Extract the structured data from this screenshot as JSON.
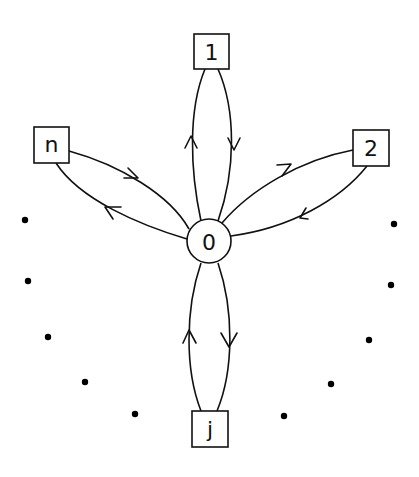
{
  "diagram": {
    "hub": {
      "label": "0",
      "cx": 209,
      "cy": 241,
      "r": 22
    },
    "nodes": [
      {
        "id": "1",
        "label": "1",
        "x": 194,
        "y": 34,
        "w": 35,
        "h": 35
      },
      {
        "id": "2",
        "label": "2",
        "x": 353,
        "y": 130,
        "w": 36,
        "h": 36
      },
      {
        "id": "n",
        "label": "n",
        "x": 34,
        "y": 127,
        "w": 35,
        "h": 36
      },
      {
        "id": "j",
        "label": "j",
        "x": 192,
        "y": 411,
        "w": 36,
        "h": 36
      }
    ],
    "edges": [
      {
        "from": "0",
        "to": "1",
        "direction": "up"
      },
      {
        "from": "1",
        "to": "0",
        "direction": "down"
      },
      {
        "from": "0",
        "to": "2",
        "direction": "out"
      },
      {
        "from": "2",
        "to": "0",
        "direction": "in"
      },
      {
        "from": "n",
        "to": "0",
        "direction": "in"
      },
      {
        "from": "0",
        "to": "n",
        "direction": "out"
      },
      {
        "from": "j",
        "to": "0",
        "direction": "up"
      },
      {
        "from": "0",
        "to": "j",
        "direction": "down"
      }
    ],
    "ellipsis_dots": {
      "left": [
        [
          25,
          220
        ],
        [
          28,
          281
        ],
        [
          48,
          337
        ],
        [
          85,
          382
        ],
        [
          135,
          414
        ]
      ],
      "right": [
        [
          394,
          224
        ],
        [
          391,
          285
        ],
        [
          369,
          340
        ],
        [
          331,
          384
        ],
        [
          284,
          416
        ]
      ]
    }
  }
}
